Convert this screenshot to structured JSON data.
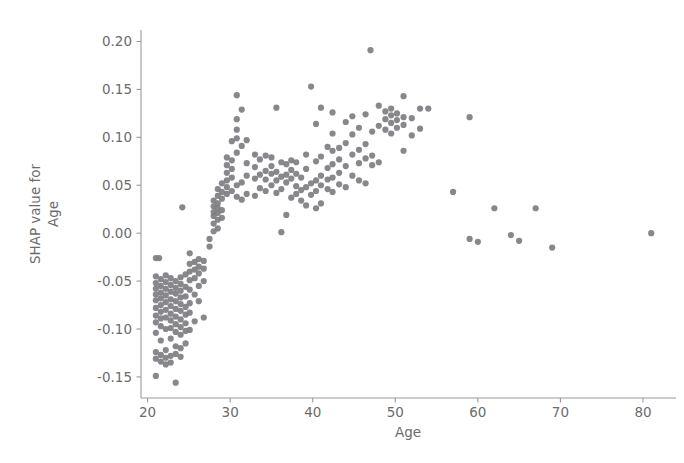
{
  "chart_data": {
    "type": "scatter",
    "title": "",
    "xlabel": "Age",
    "ylabel": "SHAP value for\nAge",
    "ylabel_line1": "SHAP value for",
    "ylabel_line2": "Age",
    "xlim": [
      19.2,
      84.0
    ],
    "ylim": [
      -0.172,
      0.212
    ],
    "xticks": [
      20,
      30,
      40,
      50,
      60,
      70,
      80
    ],
    "xtick_labels": [
      "20",
      "30",
      "40",
      "50",
      "60",
      "70",
      "80"
    ],
    "yticks": [
      -0.15,
      -0.1,
      -0.05,
      0.0,
      0.05,
      0.1,
      0.15,
      0.2
    ],
    "ytick_labels": [
      "-0.15",
      "-0.10",
      "-0.05",
      "0.00",
      "0.05",
      "0.10",
      "0.15",
      "0.20"
    ],
    "grid": false,
    "legend": false,
    "marker_color": "#7d7d82",
    "marker_size": 4.2,
    "axis_color": "#9a9a9a",
    "text_color": "#6b6b6b",
    "background": "#ffffff",
    "series": [
      {
        "name": "SHAP value for Age",
        "points": [
          [
            21.0,
            -0.026
          ],
          [
            21.4,
            -0.026
          ],
          [
            21.0,
            -0.045
          ],
          [
            21.0,
            -0.052
          ],
          [
            21.0,
            -0.058
          ],
          [
            21.0,
            -0.064
          ],
          [
            21.0,
            -0.07
          ],
          [
            21.0,
            -0.078
          ],
          [
            21.0,
            -0.086
          ],
          [
            21.0,
            -0.093
          ],
          [
            21.0,
            -0.104
          ],
          [
            21.0,
            -0.124
          ],
          [
            21.0,
            -0.131
          ],
          [
            21.0,
            -0.149
          ],
          [
            21.6,
            -0.048
          ],
          [
            21.6,
            -0.055
          ],
          [
            21.6,
            -0.062
          ],
          [
            21.6,
            -0.068
          ],
          [
            21.6,
            -0.075
          ],
          [
            21.6,
            -0.082
          ],
          [
            21.6,
            -0.089
          ],
          [
            21.6,
            -0.097
          ],
          [
            21.6,
            -0.112
          ],
          [
            21.6,
            -0.127
          ],
          [
            21.6,
            -0.134
          ],
          [
            22.2,
            -0.044
          ],
          [
            22.2,
            -0.051
          ],
          [
            22.2,
            -0.058
          ],
          [
            22.2,
            -0.065
          ],
          [
            22.2,
            -0.072
          ],
          [
            22.2,
            -0.08
          ],
          [
            22.2,
            -0.088
          ],
          [
            22.2,
            -0.1
          ],
          [
            22.2,
            -0.122
          ],
          [
            22.2,
            -0.13
          ],
          [
            22.2,
            -0.137
          ],
          [
            22.8,
            -0.047
          ],
          [
            22.8,
            -0.054
          ],
          [
            22.8,
            -0.061
          ],
          [
            22.8,
            -0.069
          ],
          [
            22.8,
            -0.076
          ],
          [
            22.8,
            -0.084
          ],
          [
            22.8,
            -0.091
          ],
          [
            22.8,
            -0.099
          ],
          [
            22.8,
            -0.11
          ],
          [
            22.8,
            -0.128
          ],
          [
            22.8,
            -0.135
          ],
          [
            23.4,
            -0.05
          ],
          [
            23.4,
            -0.057
          ],
          [
            23.4,
            -0.063
          ],
          [
            23.4,
            -0.071
          ],
          [
            23.4,
            -0.079
          ],
          [
            23.4,
            -0.087
          ],
          [
            23.4,
            -0.095
          ],
          [
            23.4,
            -0.103
          ],
          [
            23.4,
            -0.118
          ],
          [
            23.4,
            -0.126
          ],
          [
            23.4,
            -0.156
          ],
          [
            24.0,
            -0.046
          ],
          [
            24.0,
            -0.053
          ],
          [
            24.0,
            -0.06
          ],
          [
            24.0,
            -0.067
          ],
          [
            24.0,
            -0.074
          ],
          [
            24.0,
            -0.081
          ],
          [
            24.0,
            -0.09
          ],
          [
            24.0,
            -0.098
          ],
          [
            24.0,
            -0.106
          ],
          [
            24.0,
            -0.12
          ],
          [
            24.0,
            -0.129
          ],
          [
            24.6,
            -0.043
          ],
          [
            24.6,
            -0.056
          ],
          [
            24.6,
            -0.066
          ],
          [
            24.6,
            -0.077
          ],
          [
            24.6,
            -0.085
          ],
          [
            24.6,
            -0.094
          ],
          [
            24.6,
            -0.102
          ],
          [
            24.6,
            -0.115
          ],
          [
            25.1,
            -0.021
          ],
          [
            25.1,
            -0.032
          ],
          [
            25.1,
            -0.04
          ],
          [
            25.1,
            -0.049
          ],
          [
            25.1,
            -0.059
          ],
          [
            25.1,
            -0.073
          ],
          [
            25.1,
            -0.083
          ],
          [
            25.1,
            -0.101
          ],
          [
            25.7,
            -0.03
          ],
          [
            25.7,
            -0.038
          ],
          [
            25.7,
            -0.047
          ],
          [
            25.7,
            -0.064
          ],
          [
            25.7,
            -0.092
          ],
          [
            26.2,
            -0.027
          ],
          [
            26.2,
            -0.035
          ],
          [
            26.2,
            -0.042
          ],
          [
            26.2,
            -0.055
          ],
          [
            26.2,
            -0.071
          ],
          [
            26.8,
            -0.029
          ],
          [
            26.8,
            -0.037
          ],
          [
            26.8,
            -0.05
          ],
          [
            26.8,
            -0.088
          ],
          [
            24.2,
            0.027
          ],
          [
            27.5,
            -0.014
          ],
          [
            27.5,
            -0.006
          ],
          [
            28.0,
            0.002
          ],
          [
            28.0,
            0.01
          ],
          [
            28.0,
            0.018
          ],
          [
            28.0,
            0.022
          ],
          [
            28.0,
            0.028
          ],
          [
            28.0,
            0.034
          ],
          [
            28.5,
            0.005
          ],
          [
            28.5,
            0.014
          ],
          [
            28.5,
            0.021
          ],
          [
            28.5,
            0.026
          ],
          [
            28.5,
            0.031
          ],
          [
            28.5,
            0.039
          ],
          [
            28.5,
            0.046
          ],
          [
            29.0,
            0.016
          ],
          [
            29.0,
            0.024
          ],
          [
            29.0,
            0.036
          ],
          [
            29.0,
            0.043
          ],
          [
            29.0,
            0.052
          ],
          [
            29.6,
            0.041
          ],
          [
            29.6,
            0.048
          ],
          [
            29.6,
            0.055
          ],
          [
            29.6,
            0.063
          ],
          [
            29.6,
            0.071
          ],
          [
            29.6,
            0.079
          ],
          [
            30.2,
            0.044
          ],
          [
            30.2,
            0.058
          ],
          [
            30.2,
            0.067
          ],
          [
            30.2,
            0.076
          ],
          [
            30.2,
            0.096
          ],
          [
            30.8,
            0.038
          ],
          [
            30.8,
            0.05
          ],
          [
            30.8,
            0.084
          ],
          [
            30.8,
            0.099
          ],
          [
            30.8,
            0.108
          ],
          [
            30.8,
            0.119
          ],
          [
            30.8,
            0.144
          ],
          [
            31.4,
            0.035
          ],
          [
            31.4,
            0.053
          ],
          [
            31.4,
            0.091
          ],
          [
            31.4,
            0.129
          ],
          [
            32.0,
            0.041
          ],
          [
            32.0,
            0.06
          ],
          [
            32.0,
            0.073
          ],
          [
            32.0,
            0.097
          ],
          [
            33.0,
            0.039
          ],
          [
            33.0,
            0.057
          ],
          [
            33.0,
            0.069
          ],
          [
            33.0,
            0.082
          ],
          [
            33.6,
            0.047
          ],
          [
            33.6,
            0.061
          ],
          [
            33.6,
            0.077
          ],
          [
            34.3,
            0.044
          ],
          [
            34.3,
            0.056
          ],
          [
            34.3,
            0.065
          ],
          [
            34.3,
            0.081
          ],
          [
            35.0,
            0.05
          ],
          [
            35.0,
            0.062
          ],
          [
            35.0,
            0.07
          ],
          [
            35.0,
            0.079
          ],
          [
            35.6,
            0.042
          ],
          [
            35.6,
            0.055
          ],
          [
            35.6,
            0.064
          ],
          [
            35.6,
            0.131
          ],
          [
            36.2,
            0.046
          ],
          [
            36.2,
            0.059
          ],
          [
            36.2,
            0.074
          ],
          [
            36.2,
            0.001
          ],
          [
            36.8,
            0.019
          ],
          [
            36.8,
            0.053
          ],
          [
            36.8,
            0.061
          ],
          [
            36.8,
            0.072
          ],
          [
            37.4,
            0.037
          ],
          [
            37.4,
            0.057
          ],
          [
            37.4,
            0.066
          ],
          [
            37.4,
            0.076
          ],
          [
            38.0,
            0.041
          ],
          [
            38.0,
            0.049
          ],
          [
            38.0,
            0.062
          ],
          [
            38.0,
            0.074
          ],
          [
            38.6,
            0.034
          ],
          [
            38.6,
            0.045
          ],
          [
            38.6,
            0.058
          ],
          [
            39.2,
            0.029
          ],
          [
            39.2,
            0.048
          ],
          [
            39.2,
            0.067
          ],
          [
            39.2,
            0.082
          ],
          [
            39.8,
            0.04
          ],
          [
            39.8,
            0.052
          ],
          [
            39.8,
            0.153
          ],
          [
            40.4,
            0.026
          ],
          [
            40.4,
            0.044
          ],
          [
            40.4,
            0.055
          ],
          [
            40.4,
            0.075
          ],
          [
            40.4,
            0.114
          ],
          [
            41.0,
            0.031
          ],
          [
            41.0,
            0.05
          ],
          [
            41.0,
            0.06
          ],
          [
            41.0,
            0.08
          ],
          [
            41.0,
            0.131
          ],
          [
            41.8,
            0.046
          ],
          [
            41.8,
            0.056
          ],
          [
            41.8,
            0.068
          ],
          [
            41.8,
            0.09
          ],
          [
            42.4,
            0.043
          ],
          [
            42.4,
            0.058
          ],
          [
            42.4,
            0.072
          ],
          [
            42.4,
            0.086
          ],
          [
            42.4,
            0.104
          ],
          [
            42.4,
            0.126
          ],
          [
            43.2,
            0.051
          ],
          [
            43.2,
            0.063
          ],
          [
            43.2,
            0.077
          ],
          [
            43.2,
            0.089
          ],
          [
            44.0,
            0.048
          ],
          [
            44.0,
            0.07
          ],
          [
            44.0,
            0.094
          ],
          [
            44.0,
            0.116
          ],
          [
            44.8,
            0.06
          ],
          [
            44.8,
            0.082
          ],
          [
            44.8,
            0.103
          ],
          [
            44.8,
            0.122
          ],
          [
            45.6,
            0.055
          ],
          [
            45.6,
            0.073
          ],
          [
            45.6,
            0.087
          ],
          [
            45.6,
            0.11
          ],
          [
            46.4,
            0.052
          ],
          [
            46.4,
            0.078
          ],
          [
            46.4,
            0.093
          ],
          [
            46.4,
            0.124
          ],
          [
            47.0,
            0.191
          ],
          [
            47.2,
            0.071
          ],
          [
            47.2,
            0.081
          ],
          [
            47.2,
            0.106
          ],
          [
            48.0,
            0.074
          ],
          [
            48.0,
            0.112
          ],
          [
            48.0,
            0.133
          ],
          [
            48.8,
            0.108
          ],
          [
            48.8,
            0.119
          ],
          [
            48.8,
            0.127
          ],
          [
            49.5,
            0.104
          ],
          [
            49.5,
            0.115
          ],
          [
            49.5,
            0.123
          ],
          [
            49.5,
            0.13
          ],
          [
            50.2,
            0.11
          ],
          [
            50.2,
            0.118
          ],
          [
            50.2,
            0.125
          ],
          [
            51.0,
            0.086
          ],
          [
            51.0,
            0.113
          ],
          [
            51.0,
            0.121
          ],
          [
            51.0,
            0.143
          ],
          [
            52.0,
            0.102
          ],
          [
            52.0,
            0.12
          ],
          [
            53.0,
            0.109
          ],
          [
            53.0,
            0.13
          ],
          [
            54.0,
            0.13
          ],
          [
            57.0,
            0.043
          ],
          [
            59.0,
            0.121
          ],
          [
            59.0,
            -0.006
          ],
          [
            60.0,
            -0.009
          ],
          [
            62.0,
            0.026
          ],
          [
            64.0,
            -0.002
          ],
          [
            65.0,
            -0.008
          ],
          [
            67.0,
            0.026
          ],
          [
            69.0,
            -0.015
          ],
          [
            81.0,
            0.0
          ]
        ]
      }
    ]
  },
  "figure": {
    "axis_label_x": "Age",
    "axis_label_y_line1": "SHAP value for",
    "axis_label_y_line2": "Age"
  }
}
